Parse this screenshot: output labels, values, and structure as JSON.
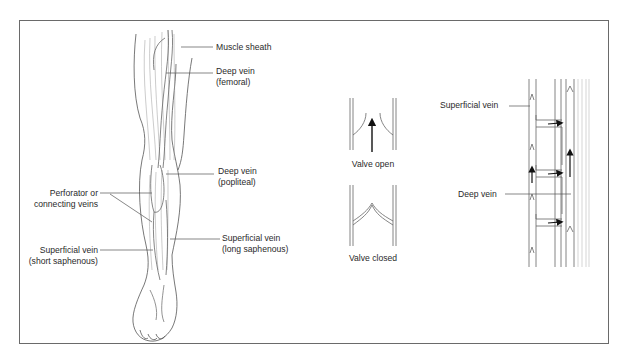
{
  "figure": {
    "leg_labels": {
      "muscle_sheath": "Muscle sheath",
      "deep_vein_femoral_1": "Deep vein",
      "deep_vein_femoral_2": "(femoral)",
      "deep_vein_popliteal_1": "Deep vein",
      "deep_vein_popliteal_2": "(popliteal)",
      "perforator_1": "Perforator or",
      "perforator_2": "connecting veins",
      "superficial_short_1": "Superficial vein",
      "superficial_short_2": "(short saphenous)",
      "superficial_long_1": "Superficial vein",
      "superficial_long_2": "(long saphenous)"
    },
    "valve_labels": {
      "open": "Valve open",
      "closed": "Valve closed"
    },
    "system_labels": {
      "superficial": "Superficial vein",
      "deep": "Deep vein"
    },
    "colors": {
      "line": "#555555",
      "frame": "#6a6a6a",
      "arrow": "#111111",
      "text": "#2a2a2a"
    }
  }
}
